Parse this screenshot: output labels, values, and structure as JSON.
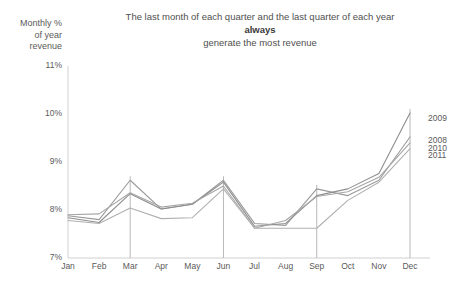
{
  "chart_data": {
    "type": "line",
    "title": "The last month of each quarter and the last quarter of each year always generate the most revenue",
    "title_lines": [
      {
        "text": "The last month of each quarter and the last quarter of each year",
        "bold": false
      },
      {
        "text": "always",
        "bold": true
      },
      {
        "text": "generate the most revenue",
        "bold": false
      }
    ],
    "ylabel": "Monthly % of year revenue",
    "ylabel_lines": [
      "Monthly %",
      "of year",
      "revenue"
    ],
    "xlabel": "",
    "categories": [
      "Jan",
      "Feb",
      "Mar",
      "Apr",
      "May",
      "Jun",
      "Jul",
      "Aug",
      "Sep",
      "Oct",
      "Nov",
      "Dec"
    ],
    "ylim": [
      7,
      11
    ],
    "yticks": [
      "7%",
      "8%",
      "9%",
      "10%",
      "11%"
    ],
    "ytick_values": [
      7,
      8,
      9,
      10,
      11
    ],
    "grid": false,
    "legend_position": "right-end-of-lines",
    "quarter_markers": [
      "Mar",
      "Jun",
      "Sep",
      "Dec"
    ],
    "series": [
      {
        "name": "2008",
        "color": "#9a9a9a",
        "label_y_pct": 9.45,
        "values": [
          7.88,
          7.8,
          8.62,
          8.02,
          8.12,
          8.62,
          7.72,
          7.68,
          8.44,
          8.3,
          8.62,
          9.52
        ]
      },
      {
        "name": "2009",
        "color": "#8e8e8e",
        "label_y_pct": 9.92,
        "values": [
          7.84,
          7.74,
          8.34,
          8.02,
          8.12,
          8.58,
          7.66,
          7.72,
          8.3,
          8.44,
          8.76,
          10.02
        ]
      },
      {
        "name": "2010",
        "color": "#a6a6a6",
        "label_y_pct": 9.3,
        "values": [
          7.9,
          7.92,
          8.36,
          8.06,
          8.14,
          8.5,
          7.62,
          7.78,
          8.28,
          8.38,
          8.68,
          9.4
        ]
      },
      {
        "name": "2011",
        "color": "#b0b0b0",
        "label_y_pct": 9.14,
        "values": [
          7.78,
          7.72,
          8.04,
          7.82,
          7.84,
          8.44,
          7.62,
          7.62,
          7.62,
          8.2,
          8.58,
          9.28
        ]
      }
    ]
  },
  "layout": {
    "plot_left": 68,
    "plot_right": 410,
    "plot_top": 66,
    "plot_bottom": 258
  }
}
